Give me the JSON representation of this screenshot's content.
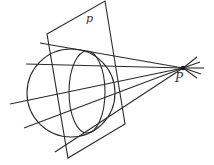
{
  "diagram": {
    "type": "geometry",
    "labels": {
      "plane": "p",
      "point": "P"
    },
    "stroke_color": "#2a2a2a",
    "plane_polygon": [
      [
        47,
        34
      ],
      [
        105,
        1
      ],
      [
        125,
        124
      ],
      [
        68,
        158
      ]
    ],
    "sphere": {
      "cx": 71,
      "cy": 93,
      "r": 44
    },
    "ellipse": {
      "cx": 87,
      "cy": 92,
      "rx": 18,
      "ry": 41
    },
    "point_P": [
      183,
      68
    ],
    "lines_to_P": [
      [
        40,
        43
      ],
      [
        26,
        64
      ],
      [
        10,
        104
      ],
      [
        24,
        128
      ],
      [
        55,
        152
      ]
    ],
    "extensions_from_P": [
      [
        197,
        57
      ],
      [
        200,
        62
      ],
      [
        204,
        68
      ],
      [
        201,
        74
      ],
      [
        197,
        78
      ]
    ]
  }
}
